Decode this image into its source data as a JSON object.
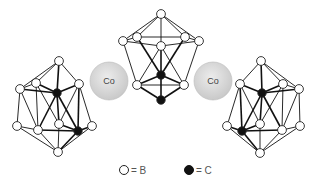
{
  "figure": {
    "metal_label": "Co",
    "colors": {
      "boron": "#ffffff",
      "carbon": "#111111",
      "metal": "#d8d8d8",
      "bond": "#111111"
    }
  },
  "metals": [
    {
      "label": "Co",
      "cx": 109,
      "cy": 81,
      "r": 19
    },
    {
      "label": "Co",
      "cx": 213,
      "cy": 81,
      "r": 19
    }
  ],
  "clusters": [
    {
      "name": "left-cluster",
      "nodes": [
        {
          "x": 59,
          "y": 61,
          "el": "B"
        },
        {
          "x": 20,
          "y": 89,
          "el": "B"
        },
        {
          "x": 36,
          "y": 83,
          "el": "B"
        },
        {
          "x": 79,
          "y": 84,
          "el": "B"
        },
        {
          "x": 57,
          "y": 93,
          "el": "C"
        },
        {
          "x": 17,
          "y": 126,
          "el": "B"
        },
        {
          "x": 38,
          "y": 130,
          "el": "B"
        },
        {
          "x": 59,
          "y": 124,
          "el": "B"
        },
        {
          "x": 92,
          "y": 126,
          "el": "B"
        },
        {
          "x": 78,
          "y": 131,
          "el": "C"
        },
        {
          "x": 58,
          "y": 152,
          "el": "B"
        }
      ],
      "bonds": [
        [
          0,
          1
        ],
        [
          0,
          2
        ],
        [
          0,
          3
        ],
        [
          0,
          4
        ],
        [
          1,
          2
        ],
        [
          2,
          4
        ],
        [
          4,
          3
        ],
        [
          1,
          4
        ],
        [
          1,
          5
        ],
        [
          1,
          6
        ],
        [
          2,
          7
        ],
        [
          2,
          6
        ],
        [
          3,
          8
        ],
        [
          3,
          9
        ],
        [
          4,
          6
        ],
        [
          4,
          9
        ],
        [
          4,
          7
        ],
        [
          5,
          6
        ],
        [
          6,
          9
        ],
        [
          9,
          8
        ],
        [
          7,
          9
        ],
        [
          5,
          10
        ],
        [
          6,
          10
        ],
        [
          8,
          10
        ],
        [
          9,
          10
        ],
        [
          7,
          10
        ],
        [
          3,
          7
        ]
      ]
    },
    {
      "name": "center-cluster",
      "nodes": [
        {
          "x": 161,
          "y": 14,
          "el": "B"
        },
        {
          "x": 123,
          "y": 41,
          "el": "B"
        },
        {
          "x": 137,
          "y": 37,
          "el": "B"
        },
        {
          "x": 161,
          "y": 46,
          "el": "B"
        },
        {
          "x": 185,
          "y": 37,
          "el": "B"
        },
        {
          "x": 199,
          "y": 41,
          "el": "B"
        },
        {
          "x": 161,
          "y": 75,
          "el": "C"
        },
        {
          "x": 137,
          "y": 85,
          "el": "B"
        },
        {
          "x": 184,
          "y": 85,
          "el": "B"
        },
        {
          "x": 161,
          "y": 100,
          "el": "C"
        }
      ],
      "bonds": [
        [
          0,
          1
        ],
        [
          0,
          2
        ],
        [
          0,
          3
        ],
        [
          0,
          4
        ],
        [
          0,
          5
        ],
        [
          1,
          2
        ],
        [
          2,
          4
        ],
        [
          4,
          5
        ],
        [
          1,
          3
        ],
        [
          3,
          5
        ],
        [
          2,
          6
        ],
        [
          4,
          6
        ],
        [
          3,
          6
        ],
        [
          3,
          7
        ],
        [
          3,
          8
        ],
        [
          1,
          7
        ],
        [
          5,
          8
        ],
        [
          7,
          8
        ],
        [
          6,
          9
        ],
        [
          7,
          9
        ],
        [
          8,
          9
        ],
        [
          6,
          7
        ],
        [
          6,
          8
        ]
      ]
    },
    {
      "name": "right-cluster",
      "nodes": [
        {
          "x": 261,
          "y": 61,
          "el": "B"
        },
        {
          "x": 240,
          "y": 84,
          "el": "B"
        },
        {
          "x": 283,
          "y": 84,
          "el": "B"
        },
        {
          "x": 299,
          "y": 89,
          "el": "B"
        },
        {
          "x": 262,
          "y": 93,
          "el": "C"
        },
        {
          "x": 227,
          "y": 126,
          "el": "B"
        },
        {
          "x": 260,
          "y": 124,
          "el": "B"
        },
        {
          "x": 282,
          "y": 130,
          "el": "B"
        },
        {
          "x": 300,
          "y": 126,
          "el": "B"
        },
        {
          "x": 242,
          "y": 131,
          "el": "C"
        },
        {
          "x": 260,
          "y": 153,
          "el": "B"
        }
      ],
      "bonds": [
        [
          0,
          1
        ],
        [
          0,
          2
        ],
        [
          0,
          3
        ],
        [
          0,
          4
        ],
        [
          2,
          3
        ],
        [
          1,
          4
        ],
        [
          4,
          2
        ],
        [
          4,
          3
        ],
        [
          1,
          5
        ],
        [
          1,
          9
        ],
        [
          2,
          6
        ],
        [
          2,
          7
        ],
        [
          3,
          7
        ],
        [
          3,
          8
        ],
        [
          4,
          7
        ],
        [
          4,
          9
        ],
        [
          4,
          6
        ],
        [
          5,
          9
        ],
        [
          9,
          7
        ],
        [
          7,
          8
        ],
        [
          6,
          9
        ],
        [
          5,
          10
        ],
        [
          9,
          10
        ],
        [
          7,
          10
        ],
        [
          8,
          10
        ],
        [
          6,
          10
        ],
        [
          1,
          6
        ]
      ]
    }
  ],
  "legend": {
    "items": [
      {
        "symbol": "open-circle",
        "label": "= B",
        "cx": 124,
        "cy": 170
      },
      {
        "symbol": "filled-circle",
        "label": "= C",
        "cx": 189,
        "cy": 170
      }
    ]
  }
}
